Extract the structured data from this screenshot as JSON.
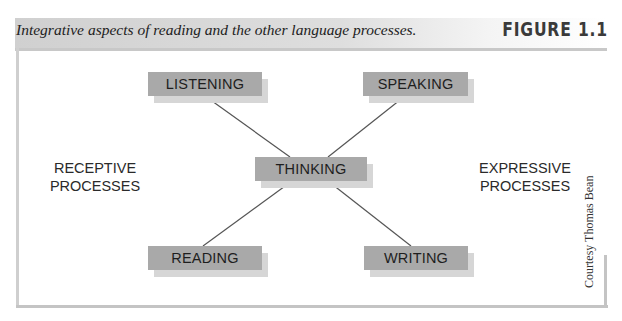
{
  "figure": {
    "caption": "Integrative aspects of reading and the other language processes.",
    "label": "FIGURE 1.1",
    "credit": "Courtesy Thomas Bean"
  },
  "diagram": {
    "center_node": "THINKING",
    "nodes": [
      {
        "id": "listening",
        "label": "LISTENING",
        "position": "top-left"
      },
      {
        "id": "speaking",
        "label": "SPEAKING",
        "position": "top-right"
      },
      {
        "id": "thinking",
        "label": "THINKING",
        "position": "center"
      },
      {
        "id": "reading",
        "label": "READING",
        "position": "bottom-left"
      },
      {
        "id": "writing",
        "label": "WRITING",
        "position": "bottom-right"
      }
    ],
    "edges": [
      [
        "listening",
        "thinking"
      ],
      [
        "speaking",
        "thinking"
      ],
      [
        "reading",
        "thinking"
      ],
      [
        "writing",
        "thinking"
      ]
    ],
    "groups": {
      "left": {
        "line1": "RECEPTIVE",
        "line2": "PROCESSES"
      },
      "right": {
        "line1": "EXPRESSIVE",
        "line2": "PROCESSES"
      }
    }
  },
  "colors": {
    "box_fill": "#a9a9a9",
    "box_shadow": "#d6d6d6",
    "line": "#555555"
  }
}
